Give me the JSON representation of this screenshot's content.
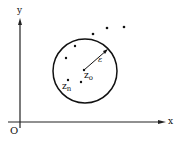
{
  "diagram": {
    "axes": {
      "x_label": "x",
      "y_label": "y",
      "origin_label": "O"
    },
    "circle": {
      "center": [
        85,
        71
      ],
      "radius": 32,
      "center_label_base": "z",
      "center_label_sub": "o",
      "radius_label": "ε",
      "radius_end": [
        108,
        49
      ]
    },
    "points": [
      {
        "x": 84,
        "y": 70,
        "label": "z0"
      },
      {
        "x": 75,
        "y": 46
      },
      {
        "x": 66,
        "y": 58
      },
      {
        "x": 68,
        "y": 80,
        "label": "zn"
      },
      {
        "x": 81,
        "y": 82
      },
      {
        "x": 93,
        "y": 34
      },
      {
        "x": 107,
        "y": 28
      },
      {
        "x": 124,
        "y": 27
      }
    ],
    "point_labels": {
      "zn_base": "z",
      "zn_sub": "n"
    },
    "colors": {
      "ink": "#111111",
      "background": "#ffffff"
    }
  }
}
